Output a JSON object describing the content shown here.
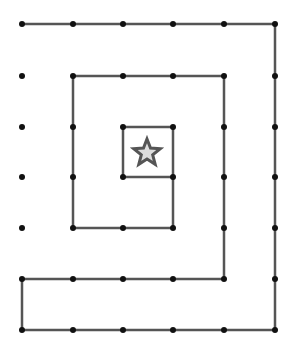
{
  "diagram": {
    "type": "spiral-path-on-dot-grid",
    "grid": {
      "xs": [
        22,
        73,
        123,
        173,
        224,
        275
      ],
      "ys": [
        24,
        76,
        127,
        177,
        228,
        279,
        330
      ]
    },
    "colors": {
      "line": "#555555",
      "dot": "#111111",
      "star_stroke": "#555555",
      "star_fill": "#dddddd",
      "background": "#ffffff"
    },
    "path": [
      [
        22,
        24
      ],
      [
        275,
        24
      ],
      [
        275,
        330
      ],
      [
        22,
        330
      ],
      [
        22,
        279
      ],
      [
        224,
        279
      ],
      [
        224,
        76
      ],
      [
        73,
        76
      ],
      [
        73,
        228
      ],
      [
        173,
        228
      ],
      [
        173,
        127
      ],
      [
        123,
        127
      ],
      [
        123,
        177
      ],
      [
        173,
        177
      ]
    ],
    "path_dots": [
      [
        22,
        24
      ],
      [
        73,
        24
      ],
      [
        123,
        24
      ],
      [
        173,
        24
      ],
      [
        224,
        24
      ],
      [
        275,
        24
      ],
      [
        275,
        76
      ],
      [
        275,
        127
      ],
      [
        275,
        177
      ],
      [
        275,
        228
      ],
      [
        275,
        279
      ],
      [
        275,
        330
      ],
      [
        224,
        330
      ],
      [
        173,
        330
      ],
      [
        123,
        330
      ],
      [
        73,
        330
      ],
      [
        22,
        330
      ],
      [
        22,
        279
      ],
      [
        73,
        279
      ],
      [
        123,
        279
      ],
      [
        173,
        279
      ],
      [
        224,
        279
      ],
      [
        224,
        228
      ],
      [
        224,
        177
      ],
      [
        224,
        127
      ],
      [
        224,
        76
      ],
      [
        173,
        76
      ],
      [
        123,
        76
      ],
      [
        73,
        76
      ],
      [
        73,
        127
      ],
      [
        73,
        177
      ],
      [
        73,
        228
      ],
      [
        123,
        228
      ],
      [
        173,
        228
      ],
      [
        173,
        177
      ],
      [
        173,
        127
      ],
      [
        123,
        127
      ],
      [
        123,
        177
      ]
    ],
    "isolated_dots": [
      [
        22,
        76
      ],
      [
        22,
        127
      ],
      [
        22,
        177
      ],
      [
        22,
        228
      ]
    ],
    "star": {
      "icon": "star-icon",
      "cx": 147,
      "cy": 153,
      "outer_r": 14,
      "inner_r": 6
    }
  }
}
